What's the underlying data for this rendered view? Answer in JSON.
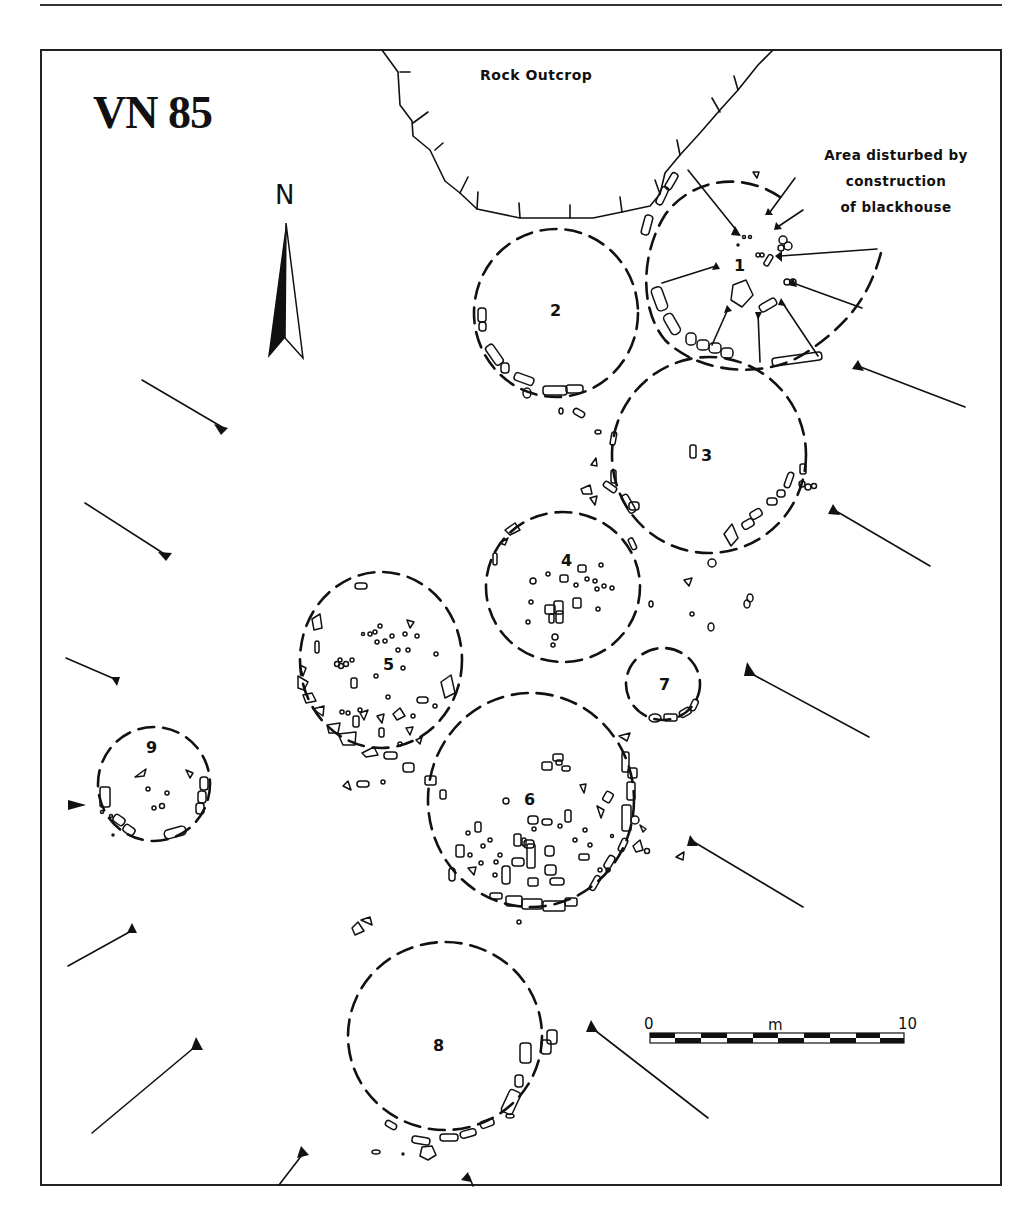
{
  "figure": {
    "title": "VN 85",
    "north_label": "N",
    "rock_outcrop_label": "Rock Outcrop",
    "annotation": {
      "lines": [
        "Area disturbed by",
        "construction",
        "of blackhouse"
      ]
    },
    "huts": [
      {
        "id": "1",
        "label": "1"
      },
      {
        "id": "2",
        "label": "2"
      },
      {
        "id": "3",
        "label": "3"
      },
      {
        "id": "4",
        "label": "4"
      },
      {
        "id": "5",
        "label": "5"
      },
      {
        "id": "6",
        "label": "6"
      },
      {
        "id": "7",
        "label": "7"
      },
      {
        "id": "8",
        "label": "8"
      },
      {
        "id": "9",
        "label": "9"
      }
    ],
    "scale_bar": {
      "start_label": "0",
      "unit_label": "m",
      "end_label": "10",
      "segments": 10
    }
  },
  "icons": {
    "north_arrow": "north-arrow-icon",
    "section_arrow": "section-arrow-icon"
  },
  "colors": {
    "ink": "#111111",
    "paper": "#ffffff"
  }
}
